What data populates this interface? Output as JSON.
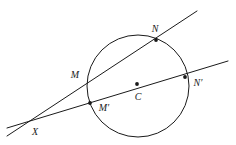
{
  "figure": {
    "type": "geometry-diagram",
    "background_color": "#ffffff",
    "stroke_color": "#1a1a1a",
    "canvas": {
      "width": 236,
      "height": 145
    },
    "circle": {
      "name": "circle",
      "cx": 138,
      "cy": 86,
      "r": 51
    },
    "points": [
      {
        "id": "N",
        "label": "N",
        "x": 156,
        "y": 40,
        "label_x": 155,
        "label_y": 29,
        "dot": true
      },
      {
        "id": "M",
        "label": "M",
        "x": 88,
        "y": 82,
        "label_x": 75,
        "label_y": 75,
        "dot": false
      },
      {
        "id": "Mp",
        "label": "M′",
        "x": 90,
        "y": 103,
        "label_x": 104,
        "label_y": 108,
        "dot": true
      },
      {
        "id": "C",
        "label": "C",
        "x": 137,
        "y": 84,
        "label_x": 138,
        "label_y": 97,
        "dot": true
      },
      {
        "id": "Np",
        "label": "N′",
        "x": 185,
        "y": 77,
        "label_x": 198,
        "label_y": 83,
        "dot": true
      },
      {
        "id": "X",
        "label": "X",
        "x": 35,
        "y": 122,
        "label_x": 35,
        "label_y": 132,
        "dot": false
      }
    ],
    "lines": [
      {
        "id": "secant-XMN",
        "x1": 7,
        "y1": 136,
        "x2": 197,
        "y2": 11
      },
      {
        "id": "secant-XMpCNp",
        "x1": 7,
        "y1": 128,
        "x2": 228,
        "y2": 61
      }
    ]
  }
}
